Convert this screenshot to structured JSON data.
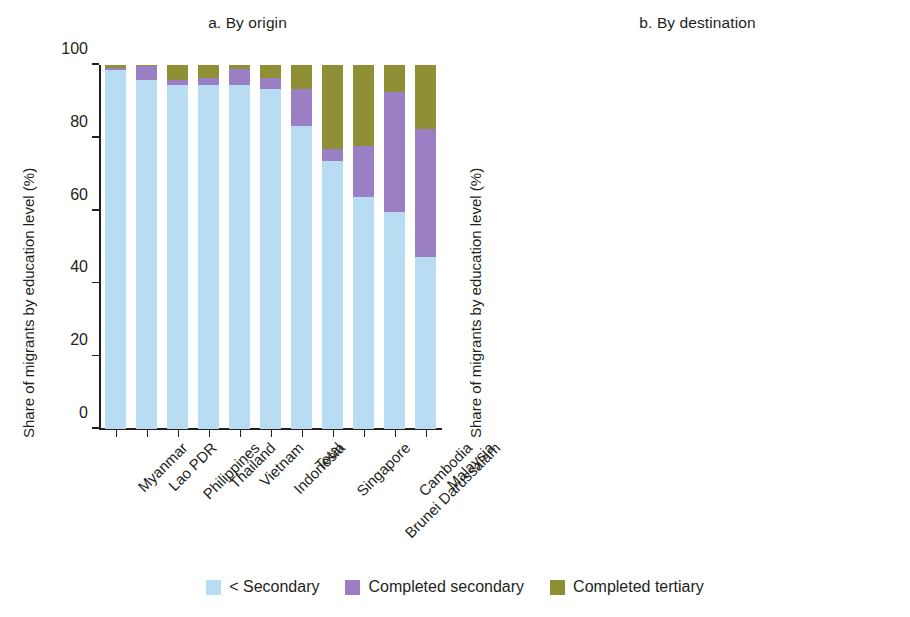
{
  "figure": {
    "y_axis_title": "Share of migrants by education level (%)",
    "y_ticks": [
      "0",
      "20",
      "40",
      "60",
      "80",
      "100"
    ]
  },
  "legend": {
    "items": [
      {
        "label": "< Secondary",
        "color": "#b8dcf2"
      },
      {
        "label": "Completed secondary",
        "color": "#9b7fc4"
      },
      {
        "label": "Completed tertiary",
        "color": "#8f8f35"
      }
    ]
  },
  "colors": {
    "less_than_secondary": "#b8dcf2",
    "completed_secondary": "#9b7fc4",
    "completed_tertiary": "#8f8f35",
    "axis": "#231f20",
    "background": "#ffffff"
  },
  "panel_a": {
    "title": "a. By origin"
  },
  "panel_b": {
    "title": "b. By destination"
  },
  "chart_data": [
    {
      "type": "bar",
      "stacked": true,
      "normalized": true,
      "title": "a. By origin",
      "xlabel": "",
      "ylabel": "Share of migrants by education level (%)",
      "ylim": [
        0,
        100
      ],
      "yticks": [
        0,
        20,
        40,
        60,
        80,
        100
      ],
      "grid": false,
      "legend_position": "bottom-center",
      "categories": [
        "Myanmar",
        "Lao PDR",
        "Philippines",
        "Thailand",
        "Vietnam",
        "Indonesia",
        "Total",
        "Singapore",
        "Brunei Darussalam",
        "Cambodia",
        "Malaysia"
      ],
      "series": [
        {
          "name": "< Secondary",
          "color": "#b8dcf2",
          "values": [
            98.7,
            96.0,
            94.6,
            94.5,
            94.4,
            93.4,
            83.2,
            73.6,
            63.8,
            59.6,
            47.3
          ]
        },
        {
          "name": "Completed secondary",
          "color": "#9b7fc4",
          "values": [
            0.6,
            3.8,
            1.4,
            1.9,
            4.5,
            3.1,
            10.1,
            3.4,
            14.0,
            33.0,
            35.0
          ]
        },
        {
          "name": "Completed tertiary",
          "color": "#8f8f35",
          "values": [
            0.7,
            0.2,
            4.0,
            3.6,
            1.1,
            3.5,
            6.7,
            23.0,
            22.2,
            7.4,
            17.7
          ]
        }
      ]
    },
    {
      "type": "bar",
      "stacked": true,
      "normalized": true,
      "title": "b. By destination",
      "xlabel": "",
      "ylabel": "Share of migrants by education level (%)",
      "ylim": [
        0,
        100
      ],
      "yticks": [
        0,
        20,
        40,
        60,
        80,
        100
      ],
      "grid": false,
      "legend_position": "bottom-center",
      "categories": [
        "Thailand",
        "Cambodia",
        "Malaysia",
        "Total",
        "Philippines",
        "Lao PDR",
        "Singapore",
        "Indonesia"
      ],
      "series": [
        {
          "name": "< Secondary",
          "color": "#b8dcf2",
          "values": [
            99.4,
            96.5,
            95.2,
            83.2,
            61.9,
            51.2,
            47.3,
            13.9
          ]
        },
        {
          "name": "Completed secondary",
          "color": "#9b7fc4",
          "values": [
            0.1,
            3.1,
            2.1,
            9.9,
            31.1,
            42.6,
            34.7,
            31.9
          ]
        },
        {
          "name": "Completed tertiary",
          "color": "#8f8f35",
          "values": [
            0.5,
            0.4,
            2.7,
            6.9,
            7.0,
            6.2,
            18.0,
            54.2
          ]
        }
      ]
    }
  ]
}
